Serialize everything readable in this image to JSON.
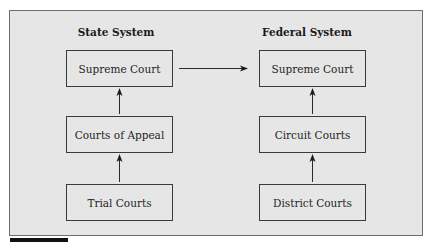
{
  "diagram": {
    "columns": [
      {
        "heading": "State System",
        "levels": [
          "Supreme Court",
          "Courts of Appeal",
          "Trial Courts"
        ]
      },
      {
        "heading": "Federal System",
        "levels": [
          "Supreme Court",
          "Circuit Courts",
          "District Courts"
        ]
      }
    ],
    "edges": [
      {
        "from": "State System / Trial Courts",
        "to": "State System / Courts of Appeal"
      },
      {
        "from": "State System / Courts of Appeal",
        "to": "State System / Supreme Court"
      },
      {
        "from": "Federal System / District Courts",
        "to": "Federal System / Circuit Courts"
      },
      {
        "from": "Federal System / Circuit Courts",
        "to": "Federal System / Supreme Court"
      },
      {
        "from": "State System / Supreme Court",
        "to": "Federal System / Supreme Court"
      }
    ],
    "colors": {
      "panel": "#e6e6e6",
      "border": "#3a3a3a",
      "accent_bar": "#111111"
    }
  }
}
